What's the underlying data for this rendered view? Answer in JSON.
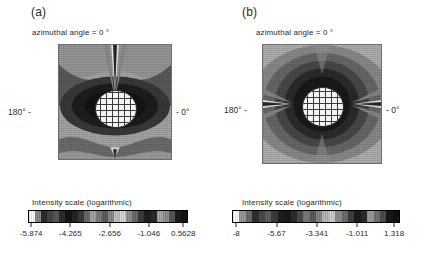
{
  "figure": {
    "background": "#ffffff",
    "panels": [
      {
        "letter": "(a)",
        "title": "azimuthal angle = 0 °",
        "left_label": "180° -",
        "right_label": "- 0°",
        "colorbar": {
          "caption": "Intensity scale (logarithmic)",
          "tick_labels": [
            "-5.874",
            "-4.265",
            "-2.656",
            "-1.046",
            "0.5628"
          ],
          "tick_values": [
            -5.874,
            -4.265,
            -2.656,
            -1.046,
            0.5628
          ],
          "tick_positions_pct": [
            2,
            26.5,
            51,
            75.5,
            97
          ],
          "segments": [
            "#121212",
            "#1d1d1d",
            "#575757",
            "#8f8f8f",
            "#a8a8a8",
            "#2a2a2a",
            "#1f1f1f",
            "#3c3c3c",
            "#6b6b6b",
            "#929292",
            "#d8d8d8",
            "#c2c2c2",
            "#8b8b8b",
            "#5e5e5e",
            "#7d7d7d",
            "#a5a5a5",
            "#6a6a6a",
            "#3a3a3a",
            "#252525",
            "#161616",
            "#2e2e2e",
            "#5a5a5a",
            "#474747",
            "#2c2c2c",
            "#8a8a8a",
            "#ffffff"
          ]
        }
      },
      {
        "letter": "(b)",
        "title": "azimuthal angle = 0 °",
        "left_label": "180° -",
        "right_label": "- 0°",
        "colorbar": {
          "caption": "Intensity scale (logarithmic)",
          "tick_labels": [
            "-8",
            "-5.67",
            "-3.341",
            "-1.011",
            "1.318"
          ],
          "tick_values": [
            -8,
            -5.67,
            -3.341,
            -1.011,
            1.318
          ],
          "tick_positions_pct": [
            2.5,
            26.5,
            50.5,
            74.5,
            96.5
          ],
          "segments": [
            "#101010",
            "#181818",
            "#4e4e4e",
            "#737373",
            "#9d9d9d",
            "#2b2b2b",
            "#1c1c1c",
            "#3f3f3f",
            "#6e6e6e",
            "#8f8f8f",
            "#cfcfcf",
            "#b8b8b8",
            "#868686",
            "#5b5b5b",
            "#7a7a7a",
            "#4b4b4b",
            "#2d2d2d",
            "#1a1a1a",
            "#1e1e1e",
            "#3b3b3b",
            "#606060",
            "#4a4a4a",
            "#2f2f2f",
            "#6d6d6d",
            "#9a9a9a",
            "#ffffff"
          ]
        }
      }
    ]
  },
  "chart_data": {
    "type": "heatmap",
    "panel_count": 2,
    "colormap": "grayscale-banded-logarithmic",
    "panels": [
      {
        "id": "a",
        "label": "(a)",
        "title": "azimuthal angle = 0 °",
        "colorbar_label": "Intensity scale (logarithmic)",
        "xlabel": "scattering angle",
        "ylabel": "",
        "angle_ticks": [
          "180°",
          "0°"
        ],
        "clim": [
          -5.874,
          0.5628
        ],
        "cticks": [
          -5.874,
          -4.265,
          -2.656,
          -1.046,
          0.5628
        ],
        "grid": false,
        "description": "Dipole-like lobed intensity field, bright forward-scatter cone at top, dark near-field lobes flanking the central meshed particle"
      },
      {
        "id": "b",
        "label": "(b)",
        "title": "azimuthal angle = 0 °",
        "colorbar_label": "Intensity scale (logarithmic)",
        "xlabel": "scattering angle",
        "ylabel": "",
        "angle_ticks": [
          "180°",
          "0°"
        ],
        "clim": [
          -8,
          1.318
        ],
        "cticks": [
          -8,
          -5.67,
          -3.341,
          -1.011,
          1.318
        ],
        "grid": false,
        "description": "Concentric banded intensity field with bright horizontal lobes extending left and right from the central meshed particle"
      }
    ]
  }
}
